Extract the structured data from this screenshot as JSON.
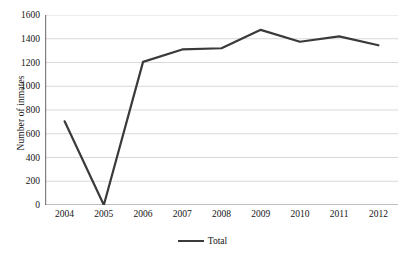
{
  "chart_data": {
    "type": "line",
    "title": "",
    "xlabel": "",
    "ylabel": "Number of inmates",
    "categories": [
      "2004",
      "2005",
      "2006",
      "2007",
      "2008",
      "2009",
      "2010",
      "2011",
      "2012"
    ],
    "series": [
      {
        "name": "Total",
        "values": [
          705,
          0,
          1205,
          1310,
          1320,
          1475,
          1375,
          1420,
          1345
        ],
        "color": "#3a3a3a"
      }
    ],
    "ylim": [
      0,
      1600
    ],
    "y_ticks": [
      0,
      200,
      400,
      600,
      800,
      1000,
      1200,
      1400,
      1600
    ],
    "y_tick_labels": [
      "0",
      "200",
      "400",
      "600",
      "800",
      "1000",
      "1200",
      "1400",
      "1600"
    ],
    "grid": "horizontal",
    "legend_position": "bottom",
    "legend_entries": [
      "Total"
    ],
    "axis_color": "#7f7f7f",
    "grid_color": "#d9d9d9",
    "background": "#ffffff"
  }
}
